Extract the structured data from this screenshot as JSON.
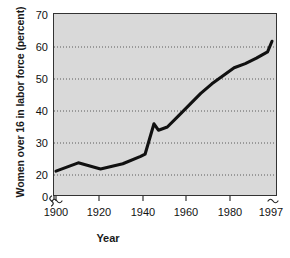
{
  "figure": {
    "ylabel": "Women over 16 in labor force (percent)",
    "xlabel": "Year",
    "caption": ""
  },
  "axis": {
    "y_ticks": [
      "0",
      "20",
      "30",
      "40",
      "50",
      "60",
      "70"
    ],
    "x_ticks": [
      "1900",
      "1920",
      "1940",
      "1960",
      "1980",
      "1997"
    ],
    "y_break": true,
    "x_break_left": true,
    "x_break_right": true
  },
  "style": {
    "plot_background": "#d9d9d9",
    "line_color": "#111111",
    "grid_color": "#4d4d4d",
    "frame_color": "#333333",
    "page_background": "#ffffff"
  },
  "chart_data": {
    "type": "line",
    "title": "",
    "xlabel": "Year",
    "ylabel": "Women over 16 in labor force (percent)",
    "xlim": [
      1900,
      1997
    ],
    "ylim": [
      17,
      70
    ],
    "y_ticks": [
      20,
      30,
      40,
      50,
      60,
      70
    ],
    "x_ticks": [
      1900,
      1920,
      1940,
      1960,
      1980,
      1997
    ],
    "grid": "horizontal-dotted",
    "legend": "none",
    "series": [
      {
        "name": "Women over 16 in labor force (percent)",
        "x": [
          1900,
          1910,
          1920,
          1930,
          1938,
          1940,
          1944,
          1946,
          1950,
          1955,
          1960,
          1965,
          1970,
          1975,
          1980,
          1985,
          1990,
          1995,
          1997
        ],
        "values": [
          21.2,
          23.8,
          21.9,
          23.5,
          25.8,
          26.5,
          36.0,
          34.0,
          35.0,
          38.5,
          42.0,
          45.5,
          48.5,
          51.0,
          53.5,
          54.8,
          56.5,
          58.5,
          61.8
        ]
      }
    ]
  }
}
